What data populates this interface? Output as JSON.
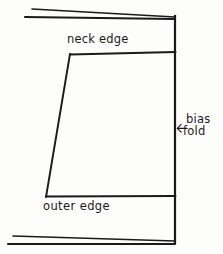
{
  "diagram": {
    "background_color": "#fdfdfc",
    "ink_color": "#1a1a1a",
    "labels": {
      "neck_edge": "neck edge",
      "outer_edge": "outer edge",
      "bias_line1": "bias",
      "bias_line2": "fold"
    },
    "arrow": {
      "name": "left-arrow-icon",
      "glyph": "←",
      "points_to": "bias fold line"
    },
    "geometry": {
      "fold_line": {
        "x": 175,
        "y_top": 16,
        "y_bottom": 243
      },
      "neck_edge_line": {
        "x1": 70,
        "y1": 54,
        "x2": 175,
        "y2": 52
      },
      "outer_edge_line": {
        "x1": 46,
        "y1": 197,
        "x2": 175,
        "y2": 196
      },
      "slanted_side": {
        "x1": 70,
        "y1": 54,
        "x2": 46,
        "y2": 197
      },
      "top_fabric_edge_upper": {
        "x1": 32,
        "y1": 9,
        "x2": 175,
        "y2": 17
      },
      "top_fabric_edge_lower": {
        "x1": 25,
        "y1": 17,
        "x2": 175,
        "y2": 19
      },
      "bottom_fabric_edge_upper": {
        "x1": 13,
        "y1": 236,
        "x2": 175,
        "y2": 241
      },
      "bottom_fabric_edge_lower": {
        "x1": 8,
        "y1": 244,
        "x2": 175,
        "y2": 244
      }
    }
  }
}
